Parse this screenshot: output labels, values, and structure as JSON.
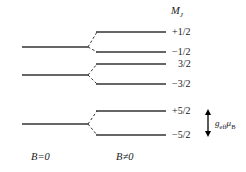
{
  "figure": {
    "type": "energy-level-splitting-diagram",
    "header": {
      "symbol": "M",
      "subscript": "J",
      "text": "MJ"
    },
    "axis_labels": {
      "left": "B=0",
      "right": "B≠0"
    },
    "annotation": {
      "symbol": "g",
      "symbol_subscript": "eff",
      "mu": "μ",
      "mu_subscript": "B",
      "text": "g_eff μ_B"
    },
    "levels": [
      {
        "group": 1,
        "left_line": {
          "x1": 22,
          "x2": 88,
          "y": 47
        },
        "split": [
          {
            "label": "+1/2",
            "x1": 96,
            "x2": 166,
            "y": 32,
            "label_x": 172,
            "label_y": 28
          },
          {
            "label": "−1/2",
            "x1": 96,
            "x2": 166,
            "y": 52,
            "label_x": 172,
            "label_y": 48
          }
        ]
      },
      {
        "group": 2,
        "left_line": {
          "x1": 22,
          "x2": 88,
          "y": 75
        },
        "split": [
          {
            "label": "3/2",
            "x1": 96,
            "x2": 166,
            "y": 64,
            "label_x": 172,
            "label_y": 60
          },
          {
            "label": "−3/2",
            "x1": 96,
            "x2": 166,
            "y": 84,
            "label_x": 172,
            "label_y": 80
          }
        ]
      },
      {
        "group": 3,
        "left_line": {
          "x1": 22,
          "x2": 88,
          "y": 124
        },
        "split": [
          {
            "label": "+5/2",
            "x1": 96,
            "x2": 166,
            "y": 111,
            "label_x": 172,
            "label_y": 107
          },
          {
            "label": "−5/2",
            "x1": 96,
            "x2": 166,
            "y": 135,
            "label_x": 172,
            "label_y": 131
          }
        ]
      }
    ],
    "arrow": {
      "x": 208,
      "y_top": 111,
      "y_bottom": 135
    },
    "colors": {
      "line": "#333333",
      "dashed": "#333333",
      "text": "#1a1a1a",
      "background": "#ffffff"
    }
  }
}
